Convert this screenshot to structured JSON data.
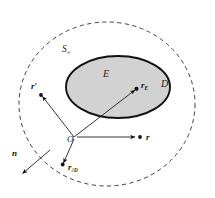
{
  "figure": {
    "kind": "geometry-diagram",
    "background_color": "#ffffff",
    "outer_boundary": {
      "name": "S-infinity boundary",
      "label": "S",
      "label_subscript": "∞",
      "style": "dashed",
      "stroke_color": "#2b2b2b",
      "fill": "none"
    },
    "exterior_region": {
      "name": "domain D",
      "label": "D"
    },
    "inner_region": {
      "name": "scatterer E",
      "label": "E",
      "fill_color": "#d2d2d2",
      "stroke_color": "#111111",
      "style": "solid"
    },
    "origin": {
      "label": "O"
    },
    "vectors": [
      {
        "id": "r-prime",
        "label": "r",
        "prime": "′",
        "subscript": "",
        "description": "source point vector to upper left"
      },
      {
        "id": "r-E",
        "label": "r",
        "prime": "",
        "subscript": "E",
        "description": "vector to point inside region E"
      },
      {
        "id": "r",
        "label": "r",
        "prime": "",
        "subscript": "",
        "description": "horizontal observation point vector"
      },
      {
        "id": "r-dD",
        "label": "r",
        "prime": "",
        "subscript": "∂D",
        "description": "vector to point on boundary of D"
      }
    ],
    "normal": {
      "id": "n",
      "label": "n",
      "description": "outward unit normal on boundary"
    }
  }
}
